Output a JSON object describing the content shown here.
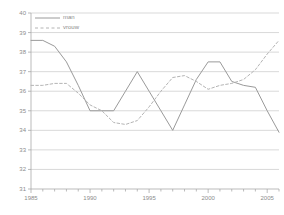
{
  "chart_data": {
    "type": "line",
    "title": "",
    "subtitle": "",
    "xlabel": "",
    "ylabel": "",
    "xlim": [
      1985,
      2006
    ],
    "ylim": [
      31,
      40
    ],
    "yticks": [
      31,
      32,
      33,
      34,
      35,
      36,
      37,
      38,
      39,
      40
    ],
    "xticks": [
      1985,
      1990,
      1995,
      2000,
      2005
    ],
    "xtick_labels": [
      "1985",
      "1990",
      "1995",
      "2000",
      "2005"
    ],
    "ytick_labels": [
      "31",
      "32",
      "33",
      "34",
      "35",
      "36",
      "37",
      "38",
      "39",
      "40"
    ],
    "minor_xticks_interval": 1,
    "grid": "horizontal",
    "legend_position": "top-left",
    "x": [
      1985,
      1986,
      1987,
      1988,
      1989,
      1990,
      1991,
      1992,
      1993,
      1994,
      1995,
      1996,
      1997,
      1998,
      1999,
      2000,
      2001,
      2002,
      2003,
      2004,
      2005,
      2006
    ],
    "series": [
      {
        "name": "man",
        "style": "solid",
        "color": "#9a9a9a",
        "values": [
          38.6,
          38.6,
          38.3,
          37.5,
          36.3,
          35.0,
          35.0,
          35.0,
          36.0,
          37.0,
          36.0,
          35.0,
          34.0,
          35.3,
          36.6,
          37.5,
          37.5,
          36.5,
          36.3,
          36.2,
          35.0,
          33.9
        ]
      },
      {
        "name": "vrouw",
        "style": "dotted",
        "color": "#b4b4b4",
        "values": [
          36.3,
          36.3,
          36.4,
          36.4,
          35.9,
          35.3,
          35.0,
          34.4,
          34.3,
          34.5,
          35.2,
          36.0,
          36.7,
          36.8,
          36.5,
          36.1,
          36.3,
          36.4,
          36.6,
          37.1,
          37.9,
          38.6
        ]
      }
    ]
  },
  "legend": {
    "entries": [
      {
        "label": "man"
      },
      {
        "label": "vrouw"
      }
    ]
  },
  "axis_colors": {
    "grid": "#c8c8c8",
    "axis": "#aaaaaa",
    "tick_text": "#8c8c8c"
  }
}
